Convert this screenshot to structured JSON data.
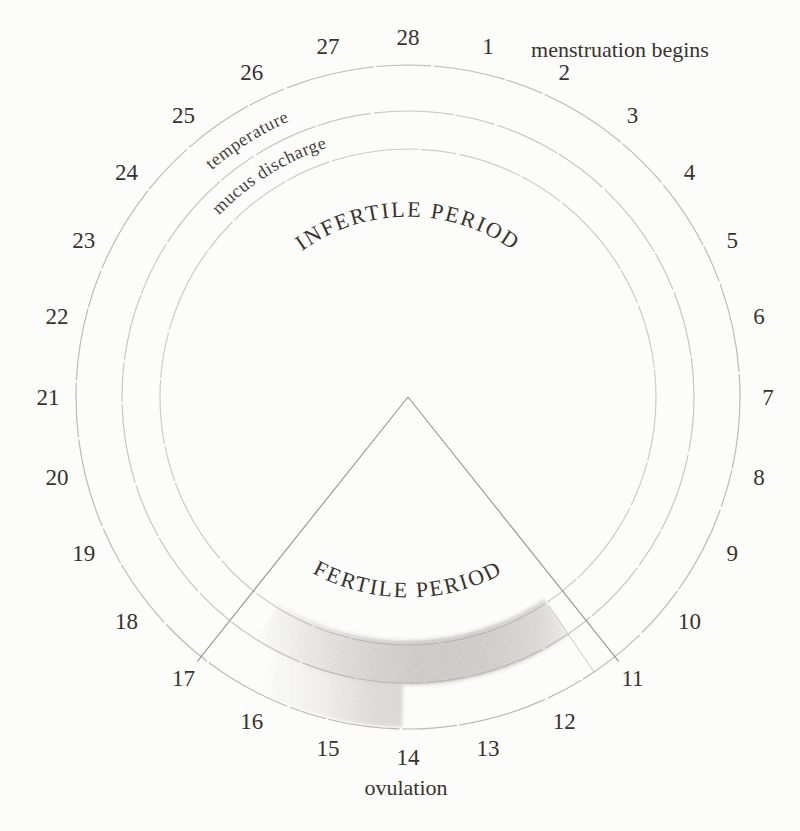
{
  "figure": {
    "type": "menstrual-cycle-fertility-wheel",
    "days_in_cycle": 28,
    "days": [
      "1",
      "2",
      "3",
      "4",
      "5",
      "6",
      "7",
      "8",
      "9",
      "10",
      "11",
      "12",
      "13",
      "14",
      "15",
      "16",
      "17",
      "18",
      "19",
      "20",
      "21",
      "22",
      "23",
      "24",
      "25",
      "26",
      "27",
      "28"
    ],
    "phases": {
      "infertile_label": "INFERTILE PERIOD",
      "fertile_label": "FERTILE PERIOD",
      "fertile_start_day": 11,
      "fertile_end_day": 17
    },
    "rings": {
      "temperature_label": "temperature",
      "mucus_label": "mucus discharge"
    },
    "events": {
      "menstruation": {
        "day": 1,
        "label": "menstruation begins"
      },
      "ovulation": {
        "day": 14,
        "label": "ovulation"
      }
    },
    "colors": {
      "background": "#fcfcfa",
      "ink": "#38332d",
      "arc": "#b5afa6",
      "wedge_line": "#90897f",
      "shading": "#8a8580"
    }
  }
}
